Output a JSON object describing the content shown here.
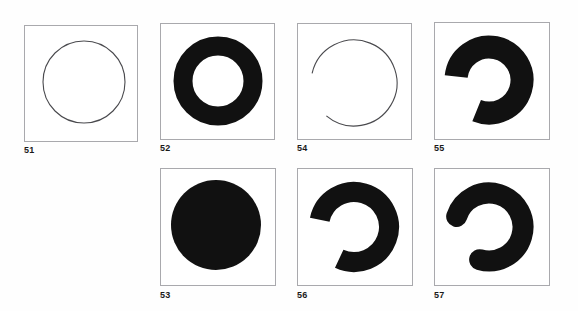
{
  "figure": {
    "kind": "geometric-shape-plate",
    "background_color": "#fefefe",
    "frame_color": "#a9a9ad",
    "ink_color": "#111111",
    "caption_color": "#1a1a1a"
  },
  "panels": [
    {
      "id": "panel-51",
      "label": "51",
      "shape_name": "thin-outline-circle",
      "shape_type": "circle-outline",
      "frame": {
        "x": 24,
        "y": 25,
        "w": 114,
        "h": 117
      },
      "geometry": {
        "cx": 60,
        "cy": 57,
        "r": 41,
        "stroke": 1.1,
        "cap": "none",
        "start_deg": 0,
        "sweep_deg": 360
      },
      "caption_pos": {
        "x": 24,
        "y": 145
      }
    },
    {
      "id": "panel-52",
      "label": "52",
      "shape_name": "thick-ring-annulus",
      "shape_type": "ring",
      "frame": {
        "x": 160,
        "y": 23,
        "w": 115,
        "h": 117
      },
      "geometry": {
        "cx": 58,
        "cy": 58,
        "r": 35,
        "stroke": 19,
        "cap": "none",
        "start_deg": 0,
        "sweep_deg": 360
      },
      "caption_pos": {
        "x": 160,
        "y": 143
      }
    },
    {
      "id": "panel-54",
      "label": "54",
      "shape_name": "thin-open-arc",
      "shape_type": "arc-outline",
      "frame": {
        "x": 297,
        "y": 23,
        "w": 115,
        "h": 117
      },
      "geometry": {
        "cx": 57,
        "cy": 60,
        "r": 43,
        "stroke": 1.1,
        "cap": "butt",
        "start_deg": 283,
        "sweep_deg": 297
      },
      "caption_pos": {
        "x": 297,
        "y": 143
      }
    },
    {
      "id": "panel-55",
      "label": "55",
      "shape_name": "thick-c-arc-flat-caps",
      "shape_type": "arc-thick",
      "frame": {
        "x": 434,
        "y": 22,
        "w": 116,
        "h": 118
      },
      "geometry": {
        "cx": 55,
        "cy": 58,
        "r": 33,
        "stroke": 23,
        "cap": "butt",
        "start_deg": 276,
        "sweep_deg": 286
      },
      "caption_pos": {
        "x": 434,
        "y": 143
      }
    },
    {
      "id": "panel-53",
      "label": "53",
      "shape_name": "filled-disk",
      "shape_type": "disk",
      "frame": {
        "x": 160,
        "y": 168,
        "w": 116,
        "h": 118
      },
      "geometry": {
        "cx": 56,
        "cy": 57,
        "r": 45,
        "stroke": 0,
        "cap": "none",
        "start_deg": 0,
        "sweep_deg": 360
      },
      "caption_pos": {
        "x": 160,
        "y": 290
      }
    },
    {
      "id": "panel-56",
      "label": "56",
      "shape_name": "medium-c-arc-flat-caps",
      "shape_type": "arc-thick",
      "frame": {
        "x": 297,
        "y": 168,
        "w": 116,
        "h": 118
      },
      "geometry": {
        "cx": 57,
        "cy": 59,
        "r": 35,
        "stroke": 20,
        "cap": "butt",
        "start_deg": 282,
        "sweep_deg": 283
      },
      "caption_pos": {
        "x": 297,
        "y": 290
      }
    },
    {
      "id": "panel-57",
      "label": "57",
      "shape_name": "medium-c-arc-round-caps",
      "shape_type": "arc-thick",
      "frame": {
        "x": 434,
        "y": 168,
        "w": 116,
        "h": 118
      },
      "geometry": {
        "cx": 55,
        "cy": 59,
        "r": 34,
        "stroke": 21,
        "cap": "round",
        "start_deg": 288,
        "sweep_deg": 268
      },
      "caption_pos": {
        "x": 434,
        "y": 290
      }
    }
  ]
}
